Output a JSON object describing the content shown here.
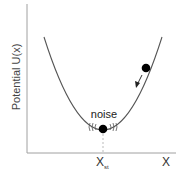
{
  "diagram": {
    "type": "potential-well",
    "y_axis_label": "Potential U(x)",
    "x_axis_label": "X",
    "stationary_label_main": "X",
    "stationary_label_sub": "st",
    "noise_label": "noise",
    "elements": [
      {
        "kind": "parabola",
        "description": "potential well U(x)",
        "vertex_at": "X_st"
      },
      {
        "kind": "ball",
        "position": "on right slope",
        "arrow": "down the slope toward minimum"
      },
      {
        "kind": "ball",
        "position": "at minimum X_st",
        "annotation": "noise",
        "fluctuation_marks": true
      },
      {
        "kind": "dashed-line",
        "from": "minimum",
        "to": "x-axis at X_st"
      }
    ],
    "colors": {
      "axis": "#999999",
      "curve": "#555555",
      "ball": "#000000",
      "text": "#333333"
    }
  }
}
